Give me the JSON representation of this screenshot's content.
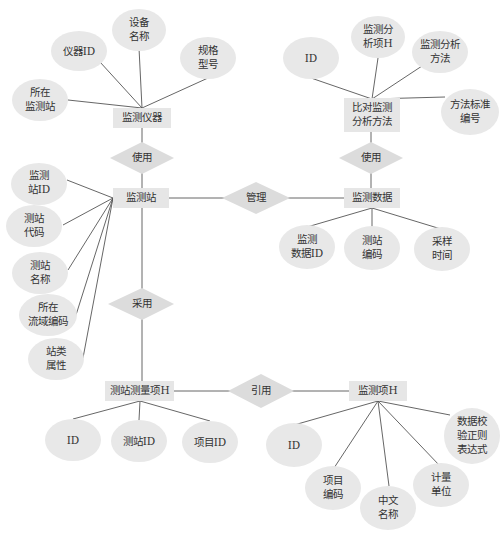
{
  "entities": {
    "instrument": "监测仪器",
    "method": [
      "比对监测",
      "分析方法"
    ],
    "station": "监测站",
    "data": "监测数据",
    "station_item": "测站测量项H",
    "item": "监测项H"
  },
  "relationships": {
    "uses_left": "使用",
    "uses_right": "使用",
    "manages": "管理",
    "adopts": "采用",
    "references": "引用"
  },
  "attributes": {
    "instrument": [
      [
        "仪器ID"
      ],
      [
        "设备",
        "名称"
      ],
      [
        "规格",
        "型号"
      ],
      [
        "所在",
        "监测站"
      ]
    ],
    "method": [
      [
        "ID"
      ],
      [
        "监测分",
        "析项H"
      ],
      [
        "监测分析",
        "方法"
      ],
      [
        "方法标准",
        "编号"
      ]
    ],
    "station": [
      [
        "监测",
        "站ID"
      ],
      [
        "测站",
        "代码"
      ],
      [
        "测站",
        "名称"
      ],
      [
        "所在",
        "流域编码"
      ],
      [
        "站类",
        "属性"
      ]
    ],
    "data": [
      [
        "监测",
        "数据ID"
      ],
      [
        "测站",
        "编码"
      ],
      [
        "采样",
        "时间"
      ]
    ],
    "station_item": [
      [
        "ID"
      ],
      [
        "测站ID"
      ],
      [
        "项目ID"
      ]
    ],
    "item": [
      [
        "ID"
      ],
      [
        "项目",
        "编码"
      ],
      [
        "中文",
        "名称"
      ],
      [
        "计量",
        "单位"
      ],
      [
        "数据校",
        "验正则",
        "表达式"
      ]
    ]
  }
}
